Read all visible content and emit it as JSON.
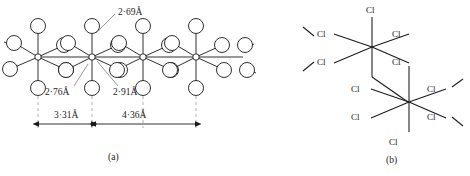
{
  "figure": {
    "panels": [
      {
        "caption": "(a)",
        "caption_x": 108,
        "caption_y": 152,
        "type": "octahedral-chain",
        "description": "chain of edge-sharing octahedra",
        "distance_labels": [
          {
            "text": "2·69Å",
            "x": 118,
            "y": 8,
            "kind": "bond-distance"
          },
          {
            "text": "2·76Å",
            "x": 45,
            "y": 88,
            "kind": "bond-distance"
          },
          {
            "text": "2·91Å",
            "x": 113,
            "y": 88,
            "kind": "bond-distance"
          },
          {
            "text": "3·31Å",
            "x": 54,
            "y": 113,
            "kind": "metal-metal-spacing"
          },
          {
            "text": "4·36Å",
            "x": 122,
            "y": 113,
            "kind": "metal-metal-spacing"
          }
        ],
        "metal_centers_x": [
          38,
          92,
          143,
          196
        ],
        "dimension_guides_x": [
          38,
          92,
          143,
          196
        ]
      },
      {
        "caption": "(b)",
        "caption_x": 386,
        "caption_y": 155,
        "type": "edge-sharing-octahedra-schematic",
        "description": "two edge-sharing octahedra drawn with explicit chlorine labels",
        "atom_labels": [
          {
            "text": "Cl",
            "x": 366,
            "y": 6,
            "site": "upper-octahedron-top"
          },
          {
            "text": "Cl",
            "x": 317,
            "y": 32,
            "site": "upper-octahedron-upper-left"
          },
          {
            "text": "Cl",
            "x": 392,
            "y": 32,
            "site": "upper-octahedron-upper-right"
          },
          {
            "text": "Cl",
            "x": 317,
            "y": 61,
            "site": "upper-octahedron-lower-left"
          },
          {
            "text": "Cl",
            "x": 392,
            "y": 61,
            "site": "bridging-upper"
          },
          {
            "text": "Cl",
            "x": 351,
            "y": 88,
            "site": "bridging-lower"
          },
          {
            "text": "Cl",
            "x": 427,
            "y": 88,
            "site": "lower-octahedron-upper-right"
          },
          {
            "text": "Cl",
            "x": 351,
            "y": 116,
            "site": "lower-octahedron-lower-left"
          },
          {
            "text": "Cl",
            "x": 427,
            "y": 116,
            "site": "lower-octahedron-lower-right"
          },
          {
            "text": "Cl",
            "x": 389,
            "y": 141,
            "site": "lower-octahedron-bottom"
          }
        ]
      }
    ],
    "colors": {
      "stroke": "#1a1a1a",
      "background": "#ffffff",
      "guide": "#7a7a7a"
    }
  }
}
